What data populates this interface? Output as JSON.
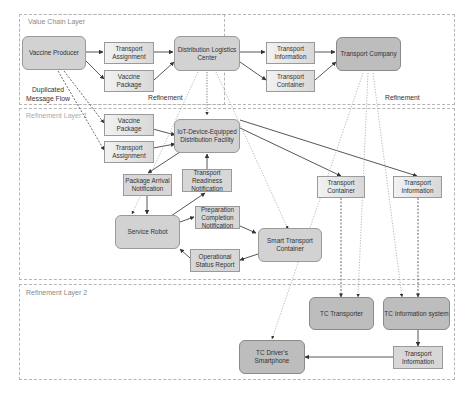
{
  "layers": [
    {
      "id": "value-chain",
      "title": "Value Chain Layer"
    },
    {
      "id": "refinement-1",
      "title": "Refinement Layer 1"
    },
    {
      "id": "refinement-2",
      "title": "Refinement Layer 2"
    }
  ],
  "nodes": {
    "vaccine_producer": "Vaccine Producer",
    "vc_transport_assignment": "Transport Assignment",
    "vc_vaccine_package": "Vaccine Package",
    "distribution_logistics_center": "Distribution Logistics Center",
    "vc_transport_information": "Transport Information",
    "vc_transport_container": "Transport Container",
    "transport_company": "Transport Company",
    "r1_vaccine_package": "Vaccine Package",
    "r1_transport_assignment": "Transport Assignment",
    "iot_facility": "IoT-Device-Equipped Distribution Facility",
    "package_arrival_notification": "Package Arrival Notification",
    "transport_readiness_notification": "Transport Readiness Notification",
    "service_robot": "Service Robot",
    "preparation_completion_notification": "Preparation Completion Notification",
    "operational_status_report": "Operational Status Report",
    "smart_transport_container": "Smart Transport Container",
    "r1_transport_container": "Transport Container",
    "r1_transport_information": "Transport Information",
    "tc_transporter": "TC Transporter",
    "tc_information_system": "TC Information system",
    "r2_transport_information": "Transport Information",
    "tc_drivers_smartphone": "TC Driver's Smartphone"
  },
  "annotations": {
    "duplicated_flow": "Duplicated Message Flow",
    "refinement_left": "Refinement",
    "refinement_right": "Refinement"
  },
  "edges": [
    {
      "from": "vaccine_producer",
      "to": "vc_transport_assignment",
      "style": "solid"
    },
    {
      "from": "vaccine_producer",
      "to": "vc_vaccine_package",
      "style": "solid"
    },
    {
      "from": "vc_transport_assignment",
      "to": "distribution_logistics_center",
      "style": "solid"
    },
    {
      "from": "vc_vaccine_package",
      "to": "distribution_logistics_center",
      "style": "solid"
    },
    {
      "from": "distribution_logistics_center",
      "to": "vc_transport_information",
      "style": "solid"
    },
    {
      "from": "distribution_logistics_center",
      "to": "vc_transport_container",
      "style": "solid"
    },
    {
      "from": "vc_transport_information",
      "to": "transport_company",
      "style": "solid"
    },
    {
      "from": "vc_transport_container",
      "to": "transport_company",
      "style": "solid"
    },
    {
      "from": "vaccine_producer",
      "to": "r1_vaccine_package",
      "style": "dashed"
    },
    {
      "from": "vaccine_producer",
      "to": "r1_transport_assignment",
      "style": "dashed"
    },
    {
      "from": "r1_vaccine_package",
      "to": "iot_facility",
      "style": "solid"
    },
    {
      "from": "r1_transport_assignment",
      "to": "iot_facility",
      "style": "solid"
    },
    {
      "from": "distribution_logistics_center",
      "to": "iot_facility",
      "style": "dotted"
    },
    {
      "from": "distribution_logistics_center",
      "to": "service_robot",
      "style": "dotted"
    },
    {
      "from": "distribution_logistics_center",
      "to": "smart_transport_container",
      "style": "dotted"
    },
    {
      "from": "iot_facility",
      "to": "package_arrival_notification",
      "style": "solid"
    },
    {
      "from": "package_arrival_notification",
      "to": "service_robot",
      "style": "solid"
    },
    {
      "from": "service_robot",
      "to": "transport_readiness_notification",
      "style": "solid"
    },
    {
      "from": "transport_readiness_notification",
      "to": "iot_facility",
      "style": "solid"
    },
    {
      "from": "service_robot",
      "to": "preparation_completion_notification",
      "style": "solid"
    },
    {
      "from": "preparation_completion_notification",
      "to": "smart_transport_container",
      "style": "solid"
    },
    {
      "from": "smart_transport_container",
      "to": "operational_status_report",
      "style": "solid"
    },
    {
      "from": "operational_status_report",
      "to": "service_robot",
      "style": "solid"
    },
    {
      "from": "iot_facility",
      "to": "r1_transport_container",
      "style": "solid"
    },
    {
      "from": "iot_facility",
      "to": "r1_transport_information",
      "style": "solid"
    },
    {
      "from": "r1_transport_container",
      "to": "tc_transporter",
      "style": "dashed"
    },
    {
      "from": "r1_transport_information",
      "to": "tc_information_system",
      "style": "dashed"
    },
    {
      "from": "transport_company",
      "to": "tc_transporter",
      "style": "dotted"
    },
    {
      "from": "transport_company",
      "to": "tc_information_system",
      "style": "dotted"
    },
    {
      "from": "transport_company",
      "to": "tc_drivers_smartphone",
      "style": "dotted"
    },
    {
      "from": "tc_information_system",
      "to": "r2_transport_information",
      "style": "solid"
    },
    {
      "from": "r2_transport_information",
      "to": "tc_drivers_smartphone",
      "style": "solid"
    }
  ]
}
